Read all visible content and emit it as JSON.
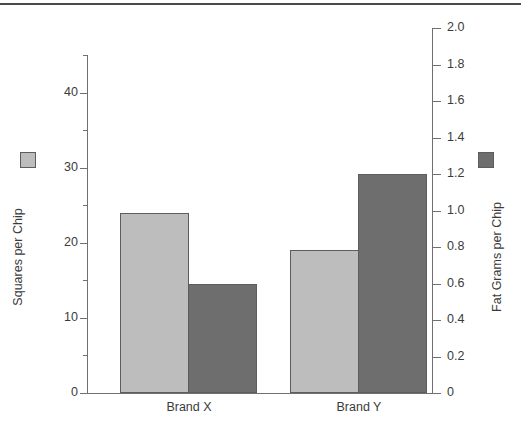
{
  "chart_data": {
    "type": "bar",
    "title": "",
    "subtitle": "",
    "categories": [
      "Brand X",
      "Brand Y"
    ],
    "series": [
      {
        "name": "Squares per Chip",
        "axis": "left",
        "color": "#bdbdbd",
        "values": [
          24,
          19
        ]
      },
      {
        "name": "Fat Grams per Chip",
        "axis": "right",
        "color": "#6e6e6e",
        "values": [
          0.6,
          1.2
        ]
      }
    ],
    "xlabel": "",
    "ylabel": "Squares per Chip",
    "y2label": "Fat Grams per Chip",
    "ylim": [
      0,
      45
    ],
    "y2lim": [
      0,
      2.0
    ],
    "grid": false,
    "legend_position": "axis-titles",
    "left_axis": {
      "label": "Squares per Chip",
      "major_ticks": [
        0,
        10,
        20,
        30,
        40
      ],
      "major_tick_labels": [
        "0",
        "10",
        "20",
        "30",
        "40"
      ],
      "minor_ticks": [
        5,
        15,
        25,
        35,
        45
      ],
      "min": 0,
      "max": 45
    },
    "right_axis": {
      "label": "Fat Grams per Chip",
      "major_ticks": [
        0,
        0.2,
        0.4,
        0.6,
        0.8,
        1.0,
        1.2,
        1.4,
        1.6,
        1.8,
        2.0
      ],
      "major_tick_labels": [
        "0",
        "0.2",
        "0.4",
        "0.6",
        "0.8",
        "1.0",
        "1.2",
        "1.4",
        "1.6",
        "1.8",
        "2.0"
      ],
      "min": 0,
      "max": 2.0
    }
  },
  "colors": {
    "bar_light": "#bdbdbd",
    "bar_dark": "#6e6e6e",
    "bar_border": "#5d5d5d",
    "axis": "#707070",
    "text": "#3b3b3b",
    "rule": "#4a4a4a",
    "background": "#ffffff"
  },
  "legend": {
    "left_series_label": "Squares per Chip",
    "right_series_label": "Fat Grams per Chip"
  }
}
